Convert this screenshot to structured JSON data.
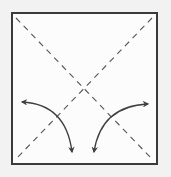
{
  "diagram": {
    "title": "",
    "type": "origami-fold-instruction",
    "colors": {
      "background": "#f2f2f2",
      "paper": "#fcfcfc",
      "border": "#3a3a3a",
      "crease": "#555555",
      "arrow": "#3f3f3f"
    },
    "square": {
      "x": 12,
      "y": 13,
      "size": 145
    },
    "creases": [
      {
        "name": "diagonal-top-left-to-bottom-right",
        "style": "valley-fold-dashed"
      },
      {
        "name": "diagonal-top-right-to-bottom-left",
        "style": "valley-fold-dashed"
      }
    ],
    "arrows": [
      {
        "name": "left-fold-arrow",
        "type": "double-headed-curved",
        "heads": [
          "left",
          "down"
        ]
      },
      {
        "name": "right-fold-arrow",
        "type": "double-headed-curved",
        "heads": [
          "right",
          "down"
        ]
      }
    ]
  }
}
